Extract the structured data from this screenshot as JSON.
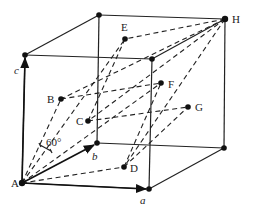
{
  "diagram": {
    "labels": {
      "A": "A",
      "B": "B",
      "C": "C",
      "D": "D",
      "E": "E",
      "F": "F",
      "G": "G",
      "H": "H",
      "a": "a",
      "b": "b",
      "c": "c",
      "angle": "60°"
    },
    "colors": {
      "line": "#222222",
      "background": "#ffffff"
    }
  }
}
